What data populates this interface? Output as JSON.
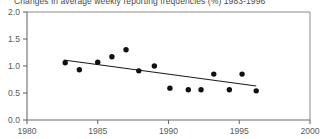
{
  "chart_data": {
    "type": "scatter",
    "title": "Changes in average weekly reporting frequencies (%) 1983-1996",
    "xlabel": "",
    "ylabel": "",
    "xlim": [
      1980,
      2000
    ],
    "ylim": [
      0.0,
      2.0
    ],
    "grid": false,
    "legend": "none",
    "x_ticks": [
      1980,
      1985,
      1990,
      1995,
      2000
    ],
    "x_tick_labels": [
      "1980",
      "1985",
      "1990",
      "1995",
      "2000"
    ],
    "y_ticks": [
      0.0,
      0.5,
      1.0,
      1.5,
      2.0
    ],
    "y_tick_labels": [
      "0.0",
      "0.5",
      "1.0",
      "1.5",
      "2.0"
    ],
    "series": [
      {
        "name": "Average weekly reporting frequency",
        "marker": "filled-circle",
        "color": "#111111",
        "points": [
          {
            "x": 1982.7,
            "y": 1.06
          },
          {
            "x": 1983.7,
            "y": 0.93
          },
          {
            "x": 1985.0,
            "y": 1.07
          },
          {
            "x": 1986.0,
            "y": 1.17
          },
          {
            "x": 1987.0,
            "y": 1.3
          },
          {
            "x": 1987.9,
            "y": 0.91
          },
          {
            "x": 1989.0,
            "y": 1.0
          },
          {
            "x": 1990.1,
            "y": 0.59
          },
          {
            "x": 1991.4,
            "y": 0.56
          },
          {
            "x": 1992.3,
            "y": 0.56
          },
          {
            "x": 1993.2,
            "y": 0.85
          },
          {
            "x": 1994.3,
            "y": 0.56
          },
          {
            "x": 1995.2,
            "y": 0.85
          },
          {
            "x": 1996.2,
            "y": 0.54
          }
        ]
      }
    ],
    "trend_line": {
      "name": "linear-regression-trend",
      "color": "#1a1a1a",
      "x_start": 1982.6,
      "y_start": 1.11,
      "x_end": 1996.2,
      "y_end": 0.63
    }
  }
}
